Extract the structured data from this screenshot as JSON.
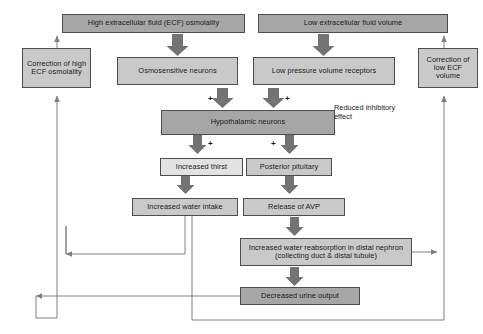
{
  "diagram": {
    "colors": {
      "box_dark": "#a6a6a6",
      "box_mid": "#c9c9c9",
      "box_light": "#e2e2e2",
      "border": "#4d4d4d",
      "line": "#808080",
      "fat_arrow": "#737373",
      "text": "#1a1a1a",
      "background": "#ffffff"
    },
    "nodes": [
      {
        "id": "high-ecf-osmolality",
        "label": "High extracellular fluid (ECF) osmolality",
        "shade": "dark"
      },
      {
        "id": "low-ecf-volume",
        "label": "Low extracellular fluid volume",
        "shade": "dark"
      },
      {
        "id": "correction-high-ecf",
        "label": "Correction of high ECF osmolality",
        "shade": "mid"
      },
      {
        "id": "correction-low-ecf",
        "label": "Correction of low ECF volume",
        "shade": "mid"
      },
      {
        "id": "osmosensitive-neurons",
        "label": "Osmosensitive neurons",
        "shade": "mid"
      },
      {
        "id": "low-pressure-receptors",
        "label": "Low pressure volume receptors",
        "shade": "mid"
      },
      {
        "id": "hypothalamic-neurons",
        "label": "Hypothalamic neurons",
        "shade": "dark"
      },
      {
        "id": "increased-thirst",
        "label": "Increased thirst",
        "shade": "light"
      },
      {
        "id": "posterior-pituitary",
        "label": "Posterior pituitary",
        "shade": "mid"
      },
      {
        "id": "increased-water-intake",
        "label": "Increased water intake",
        "shade": "mid"
      },
      {
        "id": "release-of-avp",
        "label": "Release of AVP",
        "shade": "mid"
      },
      {
        "id": "increased-reabsorption",
        "label": "Increased water reabsorption in distal nephron (collecting duct & distal tubule)",
        "shade": "mid"
      },
      {
        "id": "decreased-urine-output",
        "label": "Decreased urine output",
        "shade": "dark"
      }
    ],
    "annotations": [
      {
        "id": "reduced-inhibitory-effect",
        "text": "Reduced inhibitory effect"
      }
    ],
    "plus_signs": [
      {
        "id": "plus-osmosensitive-to-hypothalamus",
        "symbol": "+"
      },
      {
        "id": "plus-receptors-to-hypothalamus",
        "symbol": "+"
      },
      {
        "id": "plus-hypothalamus-to-thirst",
        "symbol": "+"
      },
      {
        "id": "plus-hypothalamus-to-pituitary",
        "symbol": "+"
      }
    ]
  }
}
